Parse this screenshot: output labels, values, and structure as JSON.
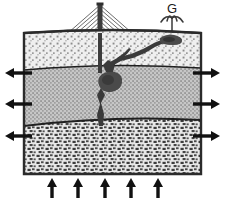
{
  "figure": {
    "type": "geological-cross-section",
    "title": "",
    "background_color": "#ffffff",
    "outline_color": "#2b2b2b",
    "width": 225,
    "height": 199
  },
  "labels": {
    "geyser": "G"
  },
  "surface": {
    "derrick": {
      "name": "drilling-derrick",
      "mast_x": 100,
      "base_y": 33,
      "apex_y": 5,
      "half_width": 32,
      "lattice_rungs": 9,
      "color": "#4a4a4a"
    },
    "geyser": {
      "name": "geyser-eruption",
      "x": 172,
      "base_y": 33,
      "jet_height": 18,
      "spray_arms": 4,
      "color": "#3a3a3a"
    }
  },
  "strata": [
    {
      "id": "upper",
      "name": "upper-layer",
      "label": "",
      "texture": "coarse-stipple",
      "fill": "#ededed",
      "dot_color": "#8a8a8a",
      "top_y": 33,
      "bottom_y": 68
    },
    {
      "id": "middle",
      "name": "middle-layer",
      "label": "",
      "texture": "fine-stipple",
      "fill": "#c9c9c9",
      "dot_color": "#6e6e6e",
      "top_y": 68,
      "bottom_y": 124
    },
    {
      "id": "lower",
      "name": "lower-layer",
      "label": "",
      "texture": "blocky-gravel",
      "fill": "#e4e4e4",
      "dot_color": "#3c3c3c",
      "top_y": 124,
      "bottom_y": 174
    }
  ],
  "conduit": {
    "name": "fracture-conduit",
    "label": "",
    "color": "#3a3a3a",
    "cavity": {
      "cx": 110,
      "cy": 82,
      "rx": 11,
      "ry": 10
    },
    "branch_to_geyser": true
  },
  "stress_arrows": {
    "left": {
      "name": "extension-arrows-left",
      "direction": "left",
      "count": 3,
      "color": "#1a1a1a",
      "ys": [
        73,
        104,
        136
      ],
      "tip_x": 6,
      "tail_x": 32
    },
    "right": {
      "name": "extension-arrows-right",
      "direction": "right",
      "count": 3,
      "color": "#1a1a1a",
      "ys": [
        73,
        104,
        136
      ],
      "tail_x": 193,
      "tip_x": 219
    },
    "bottom": {
      "name": "uplift-arrows-bottom",
      "direction": "up",
      "count": 5,
      "color": "#1a1a1a",
      "xs": [
        52,
        78,
        105,
        131,
        158
      ],
      "tail_y": 197,
      "tip_y": 178
    }
  }
}
